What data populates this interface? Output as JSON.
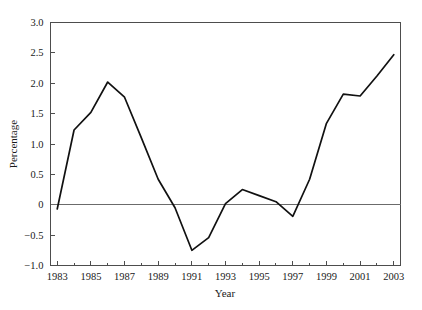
{
  "chart_data": {
    "type": "line",
    "title": "",
    "subtitle": "",
    "xlabel": "Year",
    "ylabel": "Percentage",
    "x": [
      1983,
      1984,
      1985,
      1986,
      1987,
      1988,
      1989,
      1990,
      1991,
      1992,
      1993,
      1994,
      1995,
      1996,
      1997,
      1998,
      1999,
      2000,
      2001,
      2002,
      2003
    ],
    "values": [
      -0.07,
      1.23,
      1.52,
      2.02,
      1.77,
      1.1,
      0.42,
      -0.05,
      -0.75,
      -0.54,
      0.02,
      0.25,
      0.15,
      0.05,
      -0.19,
      0.42,
      1.34,
      1.82,
      1.79,
      2.12,
      2.47
    ],
    "series": [
      {
        "name": "Percentage",
        "values": [
          -0.07,
          1.23,
          1.52,
          2.02,
          1.77,
          1.1,
          0.42,
          -0.05,
          -0.75,
          -0.54,
          0.02,
          0.25,
          0.15,
          0.05,
          -0.19,
          0.42,
          1.34,
          1.82,
          1.79,
          2.12,
          2.47
        ]
      }
    ],
    "xlim": [
      1982.6,
      2003.4
    ],
    "ylim": [
      -1.0,
      3.0
    ],
    "x_major_ticks": [
      1983,
      1985,
      1987,
      1989,
      1991,
      1993,
      1995,
      1997,
      1999,
      2001,
      2003
    ],
    "x_minor_ticks": [
      1984,
      1986,
      1988,
      1990,
      1992,
      1994,
      1996,
      1998,
      2000,
      2002
    ],
    "x_tick_labels": [
      "1983",
      "1985",
      "1987",
      "1989",
      "1991",
      "1993",
      "1995",
      "1997",
      "1999",
      "2001",
      "2003"
    ],
    "y_ticks": [
      3.0,
      2.5,
      2.0,
      1.5,
      1.0,
      0.5,
      0,
      -0.5,
      -1.0
    ],
    "y_tick_labels": [
      "3.0",
      "2.5",
      "2.0",
      "1.5",
      "1.0",
      "0.5",
      "0",
      "−0.5",
      "−1.0"
    ],
    "grid": false,
    "legend": false,
    "legend_position": "none",
    "zero_reference_line": 0,
    "line_color": "#111111",
    "frame_color": "#4d4d4d",
    "background_color": "#ffffff",
    "annotations": []
  }
}
